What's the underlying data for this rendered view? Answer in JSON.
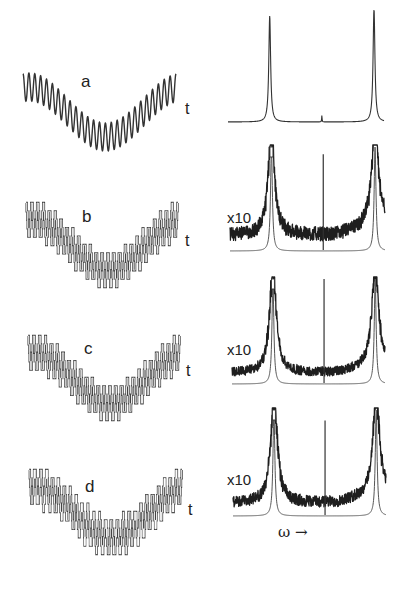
{
  "figure": {
    "panels": [
      {
        "id": "a",
        "letter": "a",
        "time_axis_label": "t",
        "signal_type": "sinusoid",
        "spectrum_scale_label": "",
        "spectrum_noise": false
      },
      {
        "id": "b",
        "letter": "b",
        "time_axis_label": "t",
        "signal_type": "quantized-step",
        "spectrum_scale_label": "x10",
        "spectrum_noise": true
      },
      {
        "id": "c",
        "letter": "c",
        "time_axis_label": "t",
        "signal_type": "quantized-step",
        "spectrum_scale_label": "x10",
        "spectrum_noise": true
      },
      {
        "id": "d",
        "letter": "d",
        "time_axis_label": "t",
        "signal_type": "quantized-dithered",
        "spectrum_scale_label": "x10",
        "spectrum_noise": true
      }
    ],
    "frequency_axis_label": "ω →"
  },
  "chart_data": [
    {
      "type": "line",
      "title": "a",
      "xlabel": "t",
      "ylabel": "",
      "description": "Fast oscillation (~26 cycles) superimposed on a slow sinusoid (~1 cycle)",
      "fast_cycles": 26,
      "slow_cycles": 1.0,
      "fast_amplitude": 1.0,
      "slow_amplitude": 1.6
    },
    {
      "type": "line",
      "title": "b",
      "xlabel": "t",
      "ylabel": "",
      "description": "Same signal coarsely quantized (step-like)",
      "quantization_levels": 10
    },
    {
      "type": "line",
      "title": "c",
      "xlabel": "t",
      "ylabel": "",
      "description": "Quantized signal, variant",
      "quantization_levels": 10
    },
    {
      "type": "line",
      "title": "d",
      "xlabel": "t",
      "ylabel": "",
      "description": "Quantized signal with dithering",
      "quantization_levels": 10
    },
    {
      "type": "line",
      "title": "spectrum a",
      "xlabel": "ω",
      "ylabel": "power",
      "peaks": [
        {
          "omega": 0.28,
          "height": 1.0
        },
        {
          "omega": 0.63,
          "height": 0.06
        },
        {
          "omega": 0.98,
          "height": 1.08
        }
      ]
    },
    {
      "type": "line",
      "title": "spectrum b",
      "scale": "x10",
      "xlabel": "ω",
      "peaks": [
        {
          "omega": 0.28,
          "height": 1.0
        },
        {
          "omega": 0.63,
          "height": 0.93
        },
        {
          "omega": 0.98,
          "height": 1.0
        }
      ],
      "noise_floor": 0.15
    },
    {
      "type": "line",
      "title": "spectrum c",
      "scale": "x10",
      "xlabel": "ω",
      "peaks": [
        {
          "omega": 0.28,
          "height": 1.0
        },
        {
          "omega": 0.63,
          "height": 1.0
        },
        {
          "omega": 0.98,
          "height": 1.0
        }
      ],
      "noise_floor": 0.1
    },
    {
      "type": "line",
      "title": "spectrum d",
      "scale": "x10",
      "xlabel": "ω",
      "peaks": [
        {
          "omega": 0.28,
          "height": 1.0
        },
        {
          "omega": 0.63,
          "height": 0.9
        },
        {
          "omega": 0.98,
          "height": 1.0
        }
      ],
      "noise_floor": 0.12
    }
  ],
  "colors": {
    "ink": "#1e1e1e",
    "thin": "#3a3a3a",
    "background": "#ffffff"
  }
}
